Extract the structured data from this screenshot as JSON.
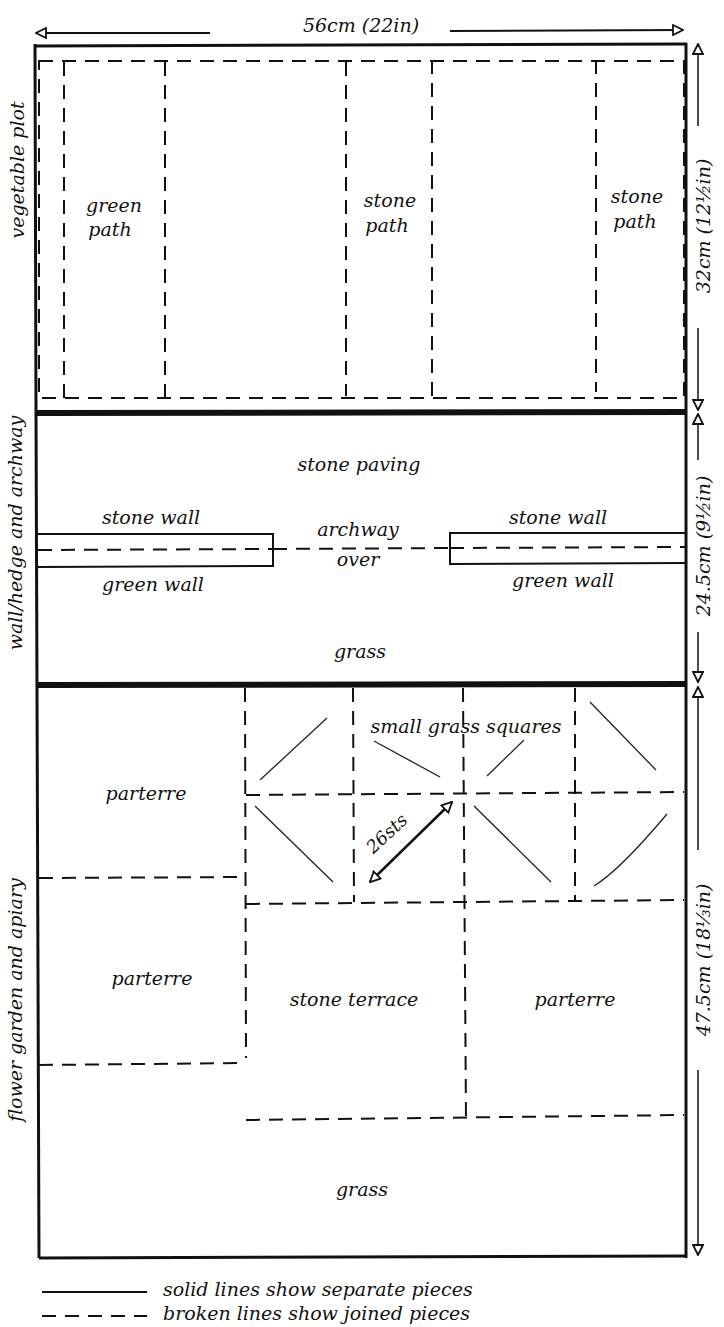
{
  "colors": {
    "ink": "#111111",
    "paper": "#ffffff"
  },
  "dimensions": {
    "width": "56cm (22in)",
    "vegetable_height": "32cm (12½in)",
    "wall_height": "24.5cm (9½in)",
    "flower_height": "47.5cm (18⅓in)"
  },
  "sections": {
    "vegetable": {
      "side_label": "vegetable plot",
      "paths": [
        {
          "line1": "green",
          "line2": "path"
        },
        {
          "line1": "stone",
          "line2": "path"
        },
        {
          "line1": "stone",
          "line2": "path"
        }
      ]
    },
    "wall": {
      "side_label": "wall/hedge and archway",
      "stone_paving": "stone paving",
      "stone_wall_left": "stone wall",
      "stone_wall_right": "stone wall",
      "green_wall_left": "green wall",
      "green_wall_right": "green wall",
      "archway": "archway",
      "over": "over",
      "grass": "grass"
    },
    "flower": {
      "side_label": "flower garden and apiary",
      "parterre_top_left": "parterre",
      "parterre_mid_left": "parterre",
      "parterre_mid_right": "parterre",
      "small_grass_squares": "small grass squares",
      "stitch_measure": "26sts",
      "stone_terrace": "stone terrace",
      "grass": "grass"
    }
  },
  "legend": {
    "solid": "solid lines show separate pieces",
    "broken": "broken lines show joined pieces"
  }
}
